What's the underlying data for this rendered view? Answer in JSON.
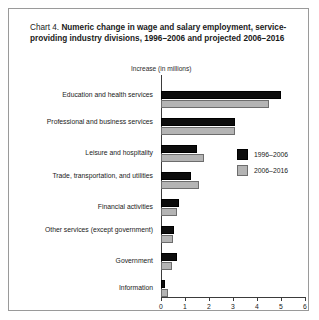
{
  "chart_label": "Chart 4.",
  "title_bold": "Numeric change in wage and salary employment, service-providing industry divisions, 1996–2006 and projected 2006–2016",
  "axis_note": "Increase (in millions)",
  "legend": [
    {
      "label": "1996–2006",
      "color": "#0d0d0d"
    },
    {
      "label": "2006–2016",
      "color": "#b4b4b4"
    }
  ],
  "chart_data": {
    "type": "bar",
    "orientation": "horizontal",
    "title": "Chart 4. Numeric change in wage and salary employment, service-providing industry divisions, 1996–2006 and projected 2006–2016",
    "xlabel": "Increase (in millions)",
    "ylabel": "",
    "xlim": [
      0,
      6
    ],
    "xticks": [
      "0",
      "1",
      "2",
      "3",
      "4",
      "5",
      "6"
    ],
    "grid": false,
    "legend_position": "middle-right",
    "categories": [
      "Education and health services",
      "Professional and business services",
      "Leisure and hospitality",
      "Trade, transportation, and utilities",
      "Financial activities",
      "Other services (except government)",
      "Government",
      "Information"
    ],
    "series": [
      {
        "name": "1996–2006",
        "color": "#0d0d0d",
        "values": [
          5.0,
          3.1,
          1.5,
          1.25,
          0.75,
          0.55,
          0.65,
          0.15
        ]
      },
      {
        "name": "2006–2016",
        "color": "#b4b4b4",
        "values": [
          4.5,
          3.1,
          1.8,
          1.6,
          0.65,
          0.5,
          0.45,
          0.3
        ]
      }
    ]
  }
}
